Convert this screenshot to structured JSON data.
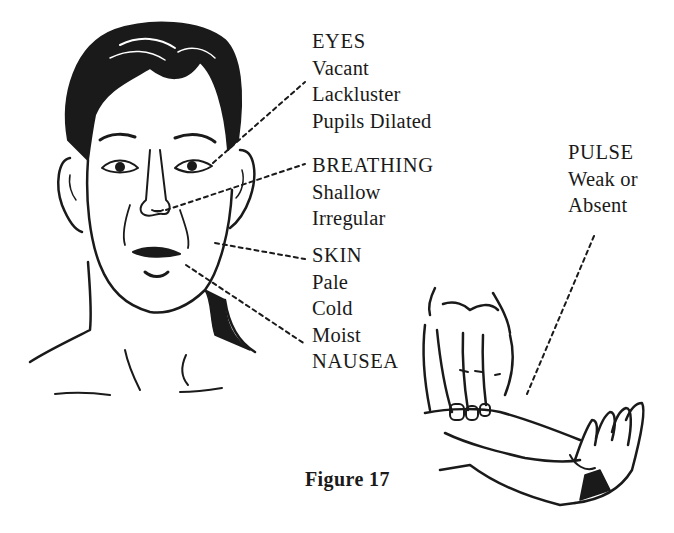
{
  "figure": {
    "caption": "Figure 17"
  },
  "labels": {
    "eyes": {
      "heading": "EYES",
      "items": [
        "Vacant",
        "Lackluster",
        "Pupils Dilated"
      ]
    },
    "breathing": {
      "heading": "BREATHING",
      "items": [
        "Shallow",
        "Irregular"
      ]
    },
    "skin": {
      "heading": "SKIN",
      "items": [
        "Pale",
        "Cold",
        "Moist"
      ]
    },
    "nausea": {
      "heading": "NAUSEA"
    },
    "pulse": {
      "heading": "PULSE",
      "items": [
        "Weak or",
        "Absent"
      ]
    }
  },
  "colors": {
    "ink": "#1a1a1a",
    "background": "#ffffff"
  }
}
